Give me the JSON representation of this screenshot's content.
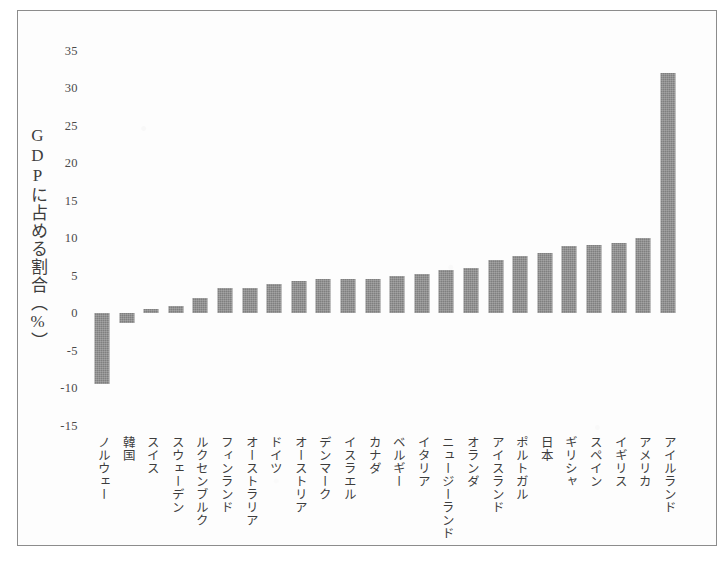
{
  "figure": {
    "frame": true,
    "background_color": "#fdfdfd",
    "border_color": "#8c8c8c"
  },
  "axis": {
    "y_title": "GDPに占める割合（%）",
    "y_ticks": [
      "35",
      "30",
      "25",
      "20",
      "15",
      "10",
      "5",
      "0",
      "-5",
      "-10",
      "-15"
    ]
  },
  "chart_data": {
    "type": "bar",
    "title": "",
    "xlabel": "",
    "ylabel": "GDPに占める割合（%）",
    "ylim": [
      -15,
      35
    ],
    "ytick_step": 5,
    "grid": false,
    "legend": "none",
    "bar_color": "#7f7f7f",
    "orientation": "vertical",
    "zero_line": 0,
    "categories": [
      "ノルウェー",
      "韓国",
      "スイス",
      "スウェーデン",
      "ルクセンブルク",
      "フィンランド",
      "オーストラリア",
      "ドイツ",
      "オーストリア",
      "デンマーク",
      "イスラエル",
      "カナダ",
      "ベルギー",
      "イタリア",
      "ニュージーランド",
      "オランダ",
      "アイスランド",
      "ポルトガル",
      "日本",
      "ギリシャ",
      "スペイン",
      "イギリス",
      "アメリカ",
      "アイルランド"
    ],
    "values": [
      -9.5,
      -1.3,
      0.5,
      0.9,
      2.0,
      3.3,
      3.3,
      3.9,
      4.3,
      4.5,
      4.5,
      4.6,
      5.0,
      5.2,
      5.7,
      6.0,
      7.1,
      7.6,
      8.0,
      8.9,
      9.1,
      9.4,
      10.0,
      32.0
    ]
  }
}
